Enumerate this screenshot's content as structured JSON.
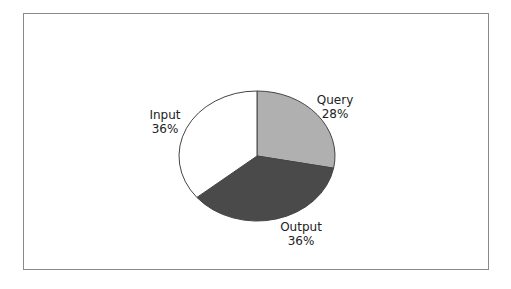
{
  "chart_data": {
    "type": "pie",
    "title": "",
    "categories": [
      "Query",
      "Output",
      "Input"
    ],
    "values": [
      28,
      36,
      36
    ],
    "unit": "%",
    "colors": [
      "#b0b0b0",
      "#4a4a4a",
      "#ffffff"
    ],
    "labels": [
      {
        "name": "Query",
        "value": "28%"
      },
      {
        "name": "Output",
        "value": "36%"
      },
      {
        "name": "Input",
        "value": "36%"
      }
    ],
    "legend": "none",
    "data_labels": "outside"
  }
}
